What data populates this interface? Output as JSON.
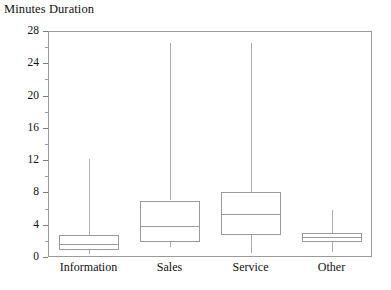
{
  "chart_data": {
    "type": "box",
    "title": "Minutes Duration",
    "xlabel": "",
    "ylabel": "Minutes Duration",
    "ylim": [
      0,
      28
    ],
    "grid": false,
    "legend": null,
    "y_ticks_major": [
      0,
      4,
      8,
      12,
      16,
      20,
      24,
      28
    ],
    "y_ticks_minor": [
      2,
      6,
      10,
      14,
      18,
      22,
      26
    ],
    "y_tick_labels": [
      "0",
      "4",
      "8",
      "12",
      "16",
      "20",
      "24",
      "28"
    ],
    "categories": [
      "Information",
      "Sales",
      "Service",
      "Other"
    ],
    "boxes": [
      {
        "category": "Information",
        "whisker_low": 0.4,
        "q1": 0.9,
        "median": 1.6,
        "q3": 2.7,
        "whisker_high": 12.1
      },
      {
        "category": "Sales",
        "whisker_low": 1.2,
        "q1": 1.8,
        "median": 3.9,
        "q3": 7.0,
        "whisker_high": 26.5
      },
      {
        "category": "Service",
        "whisker_low": 0.5,
        "q1": 2.7,
        "median": 5.3,
        "q3": 8.1,
        "whisker_high": 26.5
      },
      {
        "category": "Other",
        "whisker_low": 0.6,
        "q1": 1.9,
        "median": 2.5,
        "q3": 3.0,
        "whisker_high": 5.8
      }
    ]
  },
  "colors": {
    "line": "#9a9a9a",
    "text": "#111111",
    "background": "#ffffff"
  }
}
